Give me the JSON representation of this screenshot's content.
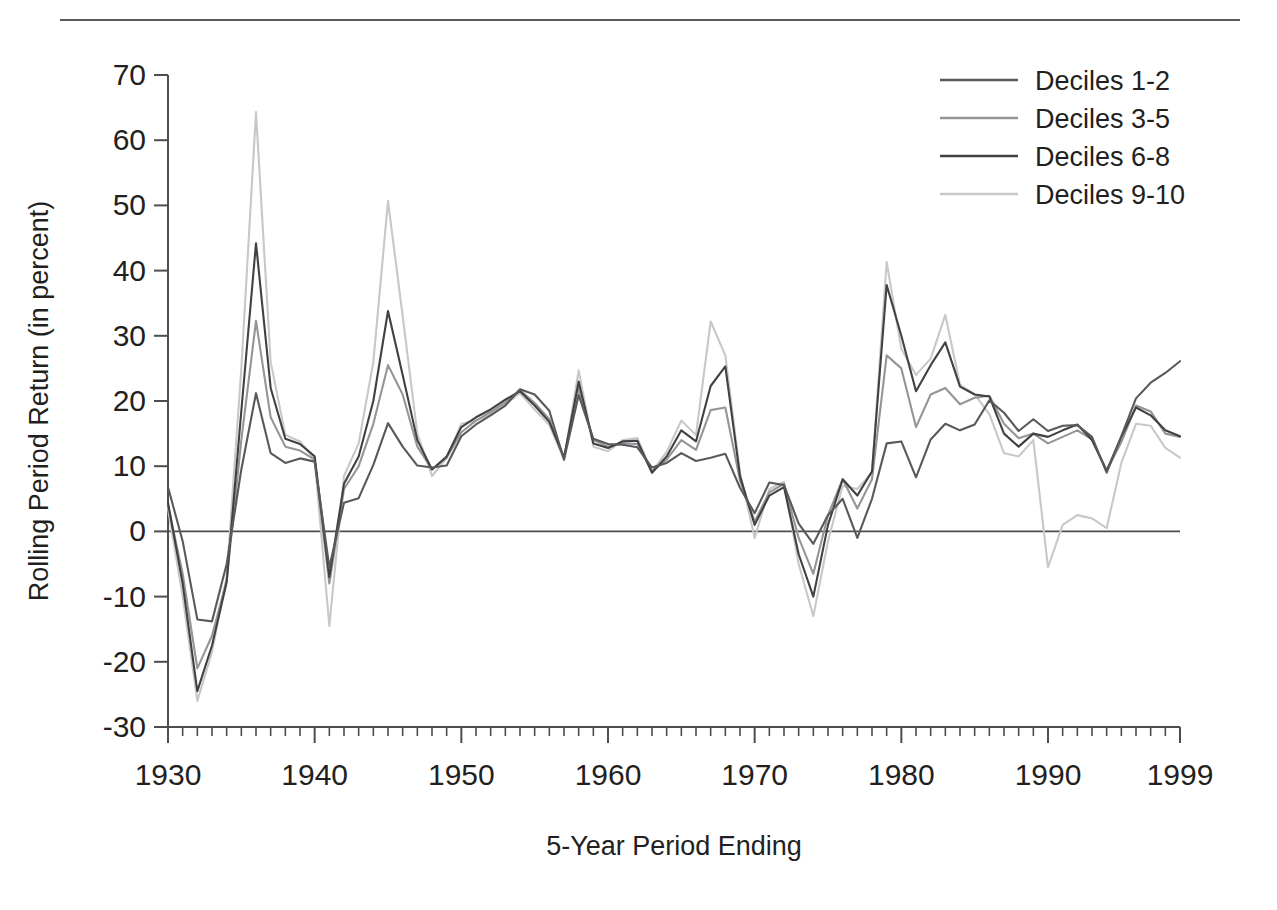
{
  "figure": {
    "background_color": "#ffffff",
    "rule_color": "#58595b",
    "axis_color": "#4d4d4f"
  },
  "chart_data": {
    "type": "line",
    "title": "",
    "xlabel": "5-Year Period Ending",
    "ylabel": "Rolling Period Return (in percent)",
    "xlim": [
      1930,
      1999
    ],
    "ylim": [
      -30,
      70
    ],
    "grid": false,
    "zero_line": true,
    "legend_position": "top-right",
    "x_ticks_major": [
      1930,
      1940,
      1950,
      1960,
      1970,
      1980,
      1990,
      1999
    ],
    "x_tick_labels": [
      "1930",
      "1940",
      "1950",
      "1960",
      "1970",
      "1980",
      "1990",
      "1999"
    ],
    "x_tick_minor_step": 1,
    "y_ticks": [
      -30,
      -20,
      -10,
      0,
      10,
      20,
      30,
      40,
      50,
      60,
      70
    ],
    "y_tick_labels": [
      "-30",
      "-20",
      "-10",
      "0",
      "10",
      "20",
      "30",
      "40",
      "50",
      "60",
      "70"
    ],
    "x": [
      1930,
      1931,
      1932,
      1933,
      1934,
      1935,
      1936,
      1937,
      1938,
      1939,
      1940,
      1941,
      1942,
      1943,
      1944,
      1945,
      1946,
      1947,
      1948,
      1949,
      1950,
      1951,
      1952,
      1953,
      1954,
      1955,
      1956,
      1957,
      1958,
      1959,
      1960,
      1961,
      1962,
      1963,
      1964,
      1965,
      1966,
      1967,
      1968,
      1969,
      1970,
      1971,
      1972,
      1973,
      1974,
      1975,
      1976,
      1977,
      1978,
      1979,
      1980,
      1981,
      1982,
      1983,
      1984,
      1985,
      1986,
      1987,
      1988,
      1989,
      1990,
      1991,
      1992,
      1993,
      1994,
      1995,
      1996,
      1997,
      1998,
      1999
    ],
    "series": [
      {
        "name": "Deciles 1-2",
        "color": "#58595b",
        "values": [
          6.8,
          -1.5,
          -13.5,
          -13.8,
          -5.0,
          9.5,
          21.2,
          12.0,
          10.5,
          11.2,
          10.7,
          -5.5,
          4.4,
          5.1,
          10.2,
          16.6,
          13.0,
          10.1,
          9.8,
          10.1,
          14.6,
          16.4,
          17.8,
          19.3,
          21.8,
          21.0,
          18.5,
          11.0,
          20.9,
          14.2,
          13.4,
          13.3,
          12.9,
          9.8,
          10.5,
          12.0,
          10.8,
          11.3,
          11.9,
          6.7,
          2.8,
          7.5,
          7.1,
          1.2,
          -1.9,
          2.5,
          5.0,
          -1.0,
          5.0,
          13.5,
          13.8,
          8.3,
          14.1,
          16.5,
          15.5,
          16.4,
          20.1,
          18.2,
          15.4,
          17.2,
          15.4,
          16.2,
          16.3,
          14.5,
          9.0,
          14.6,
          20.4,
          22.8,
          24.3,
          26.1
        ]
      },
      {
        "name": "Deciles 3-5",
        "color": "#939598",
        "values": [
          4.0,
          -6.5,
          -21.0,
          -16.0,
          -7.5,
          14.0,
          32.3,
          17.5,
          13.0,
          12.4,
          11.0,
          -8.0,
          6.5,
          10.0,
          16.5,
          25.5,
          21.0,
          13.0,
          9.5,
          11.3,
          15.2,
          17.0,
          18.3,
          19.8,
          21.7,
          19.7,
          17.2,
          11.3,
          22.0,
          14.0,
          13.0,
          13.5,
          13.4,
          9.2,
          11.0,
          14.0,
          12.5,
          18.6,
          19.0,
          7.8,
          1.5,
          6.0,
          7.3,
          -1.0,
          -6.5,
          2.5,
          8.0,
          3.5,
          8.0,
          27.0,
          25.0,
          16.0,
          21.0,
          22.0,
          19.5,
          20.5,
          20.8,
          16.5,
          14.3,
          15.0,
          13.5,
          14.5,
          15.5,
          14.1,
          9.3,
          13.7,
          19.3,
          18.4,
          15.0,
          14.5
        ]
      },
      {
        "name": "Deciles 6-8",
        "color": "#414042",
        "values": [
          4.4,
          -8.0,
          -24.5,
          -17.5,
          -7.8,
          18.5,
          44.2,
          22.0,
          14.2,
          13.4,
          11.5,
          -7.0,
          7.3,
          11.5,
          20.0,
          33.8,
          24.0,
          14.0,
          9.5,
          11.5,
          16.0,
          17.5,
          18.7,
          20.2,
          21.5,
          19.3,
          16.8,
          11.3,
          23.0,
          13.5,
          12.8,
          13.8,
          13.9,
          9.0,
          11.5,
          15.5,
          13.8,
          22.3,
          25.3,
          8.5,
          1.0,
          5.5,
          6.8,
          -3.5,
          -10.0,
          1.0,
          8.0,
          5.5,
          9.2,
          37.8,
          30.0,
          21.5,
          25.5,
          29.0,
          22.2,
          21.0,
          20.7,
          15.0,
          13.0,
          15.0,
          14.5,
          15.5,
          16.4,
          14.0,
          9.3,
          14.5,
          19.0,
          17.8,
          15.5,
          14.6
        ]
      },
      {
        "name": "Deciles 9-10",
        "color": "#c7c8ca",
        "values": [
          3.5,
          -10.0,
          -26.0,
          -18.5,
          -7.0,
          25.0,
          64.3,
          26.0,
          14.8,
          13.8,
          11.0,
          -14.5,
          8.5,
          13.5,
          26.0,
          50.7,
          33.0,
          15.0,
          8.5,
          11.3,
          16.5,
          17.0,
          18.0,
          19.5,
          21.2,
          18.7,
          16.3,
          11.0,
          24.7,
          13.0,
          12.3,
          14.0,
          14.3,
          9.2,
          12.2,
          17.0,
          14.8,
          32.2,
          27.0,
          9.0,
          -1.0,
          6.5,
          7.6,
          -5.0,
          -13.0,
          -1.5,
          7.0,
          6.5,
          9.0,
          41.3,
          28.0,
          24.0,
          26.5,
          33.2,
          22.5,
          21.0,
          18.0,
          12.0,
          11.5,
          14.0,
          -5.5,
          1.0,
          2.5,
          2.0,
          0.5,
          10.5,
          16.5,
          16.2,
          12.8,
          11.3
        ]
      }
    ]
  },
  "legend": {
    "items": [
      {
        "label": "Deciles 1-2",
        "color": "#58595b"
      },
      {
        "label": "Deciles 3-5",
        "color": "#939598"
      },
      {
        "label": "Deciles 6-8",
        "color": "#414042"
      },
      {
        "label": "Deciles 9-10",
        "color": "#c7c8ca"
      }
    ]
  }
}
